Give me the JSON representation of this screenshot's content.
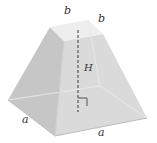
{
  "diagram": {
    "labels": {
      "top_edge_left": "b",
      "top_edge_right": "b",
      "height": "H",
      "bottom_edge_left": "a",
      "bottom_edge_right": "a"
    },
    "colors": {
      "face_left": "#c9c9c9",
      "face_front": "#dcdcdc",
      "face_top": "#ececec",
      "edge": "#bdbdbd",
      "axis": "#555555"
    }
  }
}
